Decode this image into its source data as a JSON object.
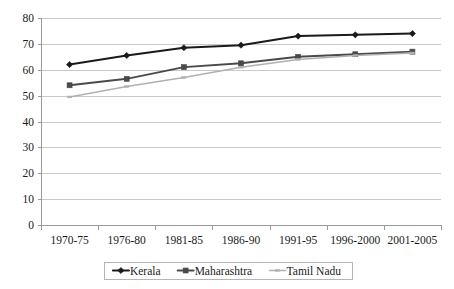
{
  "chart_data": {
    "type": "line",
    "title": "",
    "subtitle": "",
    "xlabel": "",
    "ylabel": "",
    "categories": [
      "1970-75",
      "1976-80",
      "1981-85",
      "1986-90",
      "1991-95",
      "1996-2000",
      "2001-2005"
    ],
    "ylim": [
      0,
      80
    ],
    "ytick_step": 10,
    "yticks": [
      0,
      10,
      20,
      30,
      40,
      50,
      60,
      70,
      80
    ],
    "grid": true,
    "grid_axis": "y",
    "legend_position": "bottom-center",
    "series": [
      {
        "name": "Kerala",
        "color": "#1a1a1a",
        "marker": "diamond",
        "values": [
          62.0,
          65.5,
          68.5,
          69.5,
          73.0,
          73.5,
          74.0
        ]
      },
      {
        "name": "Maharashtra",
        "color": "#4a4a4a",
        "marker": "square",
        "values": [
          54.0,
          56.5,
          61.0,
          62.5,
          65.0,
          66.0,
          67.0
        ]
      },
      {
        "name": "Tamil Nadu",
        "color": "#b0b0b0",
        "marker": "dash",
        "values": [
          49.5,
          53.5,
          57.0,
          61.0,
          64.0,
          65.5,
          66.5
        ]
      }
    ]
  },
  "axes": {
    "y_tick_labels": [
      "0",
      "10",
      "20",
      "30",
      "40",
      "50",
      "60",
      "70",
      "80"
    ],
    "x_tick_labels": [
      "1970-75",
      "1976-80",
      "1981-85",
      "1986-90",
      "1991-95",
      "1996-2000",
      "2001-2005"
    ]
  },
  "legend": {
    "entries": [
      {
        "label": "Kerala",
        "color": "#1a1a1a",
        "marker": "diamond"
      },
      {
        "label": "Maharashtra",
        "color": "#4a4a4a",
        "marker": "square"
      },
      {
        "label": "Tamil Nadu",
        "color": "#b0b0b0",
        "marker": "dash"
      }
    ]
  },
  "colors": {
    "gridline": "#c9c9c9",
    "axis": "#9a9a9a",
    "text": "#1a1a1a",
    "background": "#ffffff",
    "legend_border": "#b5b5b5"
  }
}
